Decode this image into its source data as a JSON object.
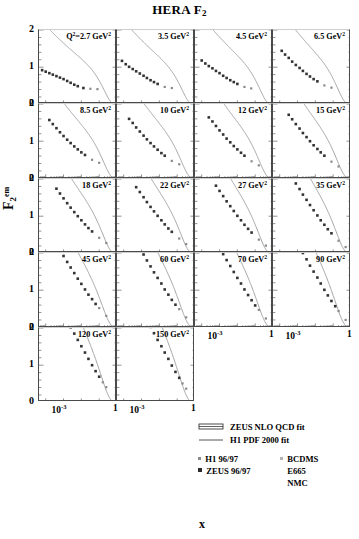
{
  "title": "HERA F2",
  "title_main": "HERA F",
  "title_sub": "2",
  "axes": {
    "ylabel_main": "F",
    "ylabel_sub": "2",
    "ylabel_sup": "em",
    "xlabel": "x",
    "yticks": [
      "2",
      "1",
      "0"
    ],
    "ylim": [
      0,
      2
    ],
    "xticks": [
      {
        "mantissa": "10",
        "exp": "-3"
      },
      {
        "mantissa": "1",
        "exp": ""
      }
    ],
    "xlim_decades": [
      -4.3,
      0
    ]
  },
  "panels": [
    {
      "row": 0,
      "col": 0,
      "label_prefix": "Q",
      "label_sup": "2",
      "label_eq": "=2.7 GeV",
      "label_sup2": "2",
      "q2": 2.7
    },
    {
      "row": 0,
      "col": 1,
      "label_prefix": "",
      "label_sup": "",
      "label_eq": "3.5 GeV",
      "label_sup2": "2",
      "q2": 3.5
    },
    {
      "row": 0,
      "col": 2,
      "label_prefix": "",
      "label_sup": "",
      "label_eq": "4.5 GeV",
      "label_sup2": "2",
      "q2": 4.5
    },
    {
      "row": 0,
      "col": 3,
      "label_prefix": "",
      "label_sup": "",
      "label_eq": "6.5 GeV",
      "label_sup2": "2",
      "q2": 6.5
    },
    {
      "row": 1,
      "col": 0,
      "label_prefix": "",
      "label_sup": "",
      "label_eq": "8.5 GeV",
      "label_sup2": "2",
      "q2": 8.5
    },
    {
      "row": 1,
      "col": 1,
      "label_prefix": "",
      "label_sup": "",
      "label_eq": "10 GeV",
      "label_sup2": "2",
      "q2": 10
    },
    {
      "row": 1,
      "col": 2,
      "label_prefix": "",
      "label_sup": "",
      "label_eq": "12 GeV",
      "label_sup2": "2",
      "q2": 12
    },
    {
      "row": 1,
      "col": 3,
      "label_prefix": "",
      "label_sup": "",
      "label_eq": "15 GeV",
      "label_sup2": "2",
      "q2": 15
    },
    {
      "row": 2,
      "col": 0,
      "label_prefix": "",
      "label_sup": "",
      "label_eq": "18 GeV",
      "label_sup2": "2",
      "q2": 18
    },
    {
      "row": 2,
      "col": 1,
      "label_prefix": "",
      "label_sup": "",
      "label_eq": "22 GeV",
      "label_sup2": "2",
      "q2": 22
    },
    {
      "row": 2,
      "col": 2,
      "label_prefix": "",
      "label_sup": "",
      "label_eq": "27 GeV",
      "label_sup2": "2",
      "q2": 27
    },
    {
      "row": 2,
      "col": 3,
      "label_prefix": "",
      "label_sup": "",
      "label_eq": "35 GeV",
      "label_sup2": "2",
      "q2": 35
    },
    {
      "row": 3,
      "col": 0,
      "label_prefix": "",
      "label_sup": "",
      "label_eq": "45 GeV",
      "label_sup2": "2",
      "q2": 45
    },
    {
      "row": 3,
      "col": 1,
      "label_prefix": "",
      "label_sup": "",
      "label_eq": "60 GeV",
      "label_sup2": "2",
      "q2": 60
    },
    {
      "row": 3,
      "col": 2,
      "label_prefix": "",
      "label_sup": "",
      "label_eq": "70 GeV",
      "label_sup2": "2",
      "q2": 70
    },
    {
      "row": 3,
      "col": 3,
      "label_prefix": "",
      "label_sup": "",
      "label_eq": "90 GeV",
      "label_sup2": "2",
      "q2": 90
    },
    {
      "row": 4,
      "col": 0,
      "label_prefix": "",
      "label_sup": "",
      "label_eq": "120 GeV",
      "label_sup2": "2",
      "q2": 120
    },
    {
      "row": 4,
      "col": 1,
      "label_prefix": "",
      "label_sup": "",
      "label_eq": "150 GeV",
      "label_sup2": "2",
      "q2": 150
    }
  ],
  "legend": {
    "fits": [
      {
        "text": "ZEUS NLO QCD fit",
        "style": "band"
      },
      {
        "text": "H1 PDF 2000 fit",
        "style": "line"
      }
    ],
    "markers_left": [
      {
        "text": "H1 96/97",
        "color": "#8a8a8a",
        "size": 3
      },
      {
        "text": "ZEUS 96/97",
        "color": "#2b2b2b",
        "size": 4
      }
    ],
    "markers_right": [
      {
        "text": "BCDMS",
        "color": "#b4b4b4",
        "size": 3
      },
      {
        "text": "E665",
        "color": "",
        "size": 0
      },
      {
        "text": "NMC",
        "color": "",
        "size": 0
      }
    ]
  },
  "colors": {
    "zeus_marker": "#333333",
    "h1_marker": "#8a8a8a",
    "fit_curve": "#9a9a9a",
    "axis": "#4a4a4a",
    "background": "#ffffff"
  },
  "chart_data": {
    "type": "scatter",
    "title": "HERA F2",
    "xlabel": "x",
    "ylabel": "F2 em",
    "xscale": "log",
    "ylim": [
      0,
      2
    ],
    "xlim": [
      5e-05,
      1.0
    ],
    "grid": false,
    "legend_position": "bottom-right",
    "panels": [
      {
        "q2": 2.7,
        "x": [
          6.3e-05,
          0.0001,
          0.00016,
          0.00025,
          0.0004,
          0.00063,
          0.001,
          0.0016,
          0.0025,
          0.004,
          0.0063,
          0.013,
          0.032,
          0.08
        ],
        "f2": [
          0.92,
          0.88,
          0.84,
          0.8,
          0.76,
          0.72,
          0.68,
          0.63,
          0.58,
          0.53,
          0.49,
          0.44,
          0.42,
          0.41
        ]
      },
      {
        "q2": 3.5,
        "x": [
          8e-05,
          0.00013,
          0.0002,
          0.00032,
          0.0005,
          0.0008,
          0.0013,
          0.002,
          0.0032,
          0.005,
          0.008,
          0.02,
          0.05
        ],
        "f2": [
          1.17,
          1.08,
          1.01,
          0.95,
          0.89,
          0.83,
          0.77,
          0.71,
          0.65,
          0.6,
          0.55,
          0.47,
          0.44
        ]
      },
      {
        "q2": 4.5,
        "x": [
          0.0001,
          0.00016,
          0.00025,
          0.0004,
          0.00063,
          0.001,
          0.0016,
          0.0025,
          0.004,
          0.0063,
          0.01,
          0.025,
          0.06
        ],
        "f2": [
          1.18,
          1.1,
          1.03,
          0.97,
          0.9,
          0.84,
          0.77,
          0.71,
          0.65,
          0.6,
          0.55,
          0.47,
          0.43
        ]
      },
      {
        "q2": 6.5,
        "x": [
          0.00013,
          0.0002,
          0.00032,
          0.0005,
          0.0008,
          0.0013,
          0.002,
          0.0032,
          0.005,
          0.008,
          0.013,
          0.032,
          0.08
        ],
        "f2": [
          1.44,
          1.34,
          1.25,
          1.15,
          1.06,
          0.98,
          0.9,
          0.82,
          0.75,
          0.68,
          0.62,
          0.51,
          0.45
        ]
      },
      {
        "q2": 8.5,
        "x": [
          0.00016,
          0.00025,
          0.0004,
          0.00063,
          0.001,
          0.0016,
          0.0025,
          0.004,
          0.0063,
          0.01,
          0.016,
          0.04,
          0.1
        ],
        "f2": [
          1.57,
          1.46,
          1.35,
          1.24,
          1.14,
          1.04,
          0.95,
          0.86,
          0.78,
          0.7,
          0.63,
          0.5,
          0.42
        ]
      },
      {
        "q2": 10,
        "x": [
          0.0002,
          0.00032,
          0.0005,
          0.0008,
          0.0013,
          0.002,
          0.0032,
          0.005,
          0.008,
          0.013,
          0.02,
          0.05,
          0.13
        ],
        "f2": [
          1.6,
          1.49,
          1.37,
          1.26,
          1.15,
          1.05,
          0.95,
          0.86,
          0.77,
          0.68,
          0.61,
          0.47,
          0.38
        ]
      },
      {
        "q2": 12,
        "x": [
          0.00025,
          0.0004,
          0.00063,
          0.001,
          0.0016,
          0.0025,
          0.004,
          0.0063,
          0.01,
          0.016,
          0.025,
          0.063,
          0.16
        ],
        "f2": [
          1.64,
          1.53,
          1.41,
          1.29,
          1.18,
          1.07,
          0.97,
          0.87,
          0.78,
          0.69,
          0.61,
          0.46,
          0.35
        ]
      },
      {
        "q2": 15,
        "x": [
          0.00032,
          0.0005,
          0.0008,
          0.0013,
          0.002,
          0.0032,
          0.005,
          0.008,
          0.013,
          0.02,
          0.032,
          0.08,
          0.2
        ],
        "f2": [
          1.71,
          1.59,
          1.46,
          1.34,
          1.22,
          1.11,
          1.0,
          0.89,
          0.79,
          0.7,
          0.61,
          0.45,
          0.32
        ]
      },
      {
        "q2": 18,
        "x": [
          0.0004,
          0.00063,
          0.001,
          0.0016,
          0.0025,
          0.004,
          0.0063,
          0.01,
          0.016,
          0.025,
          0.04,
          0.1,
          0.25
        ],
        "f2": [
          1.74,
          1.61,
          1.48,
          1.35,
          1.23,
          1.11,
          1.0,
          0.89,
          0.78,
          0.68,
          0.59,
          0.42,
          0.28
        ]
      },
      {
        "q2": 22,
        "x": [
          0.0005,
          0.0008,
          0.0013,
          0.002,
          0.0032,
          0.005,
          0.008,
          0.013,
          0.02,
          0.032,
          0.05,
          0.13,
          0.32
        ],
        "f2": [
          1.78,
          1.65,
          1.51,
          1.38,
          1.25,
          1.13,
          1.01,
          0.89,
          0.78,
          0.67,
          0.58,
          0.4,
          0.25
        ]
      },
      {
        "q2": 27,
        "x": [
          0.00063,
          0.001,
          0.0016,
          0.0025,
          0.004,
          0.0063,
          0.01,
          0.016,
          0.025,
          0.04,
          0.063,
          0.16,
          0.4
        ],
        "f2": [
          1.82,
          1.68,
          1.54,
          1.4,
          1.27,
          1.14,
          1.01,
          0.89,
          0.77,
          0.66,
          0.56,
          0.37,
          0.21
        ]
      },
      {
        "q2": 35,
        "x": [
          0.0008,
          0.0013,
          0.002,
          0.0032,
          0.005,
          0.008,
          0.013,
          0.02,
          0.032,
          0.05,
          0.08,
          0.2,
          0.5
        ],
        "f2": [
          1.88,
          1.73,
          1.58,
          1.44,
          1.3,
          1.16,
          1.02,
          0.89,
          0.77,
          0.65,
          0.54,
          0.34,
          0.17
        ]
      },
      {
        "q2": 45,
        "x": [
          0.001,
          0.0016,
          0.0025,
          0.004,
          0.0063,
          0.01,
          0.016,
          0.025,
          0.04,
          0.063,
          0.1,
          0.25
        ],
        "f2": [
          1.92,
          1.76,
          1.61,
          1.46,
          1.31,
          1.17,
          1.02,
          0.88,
          0.76,
          0.63,
          0.52,
          0.31
        ]
      },
      {
        "q2": 60,
        "x": [
          0.0013,
          0.002,
          0.0032,
          0.005,
          0.008,
          0.013,
          0.02,
          0.032,
          0.05,
          0.08,
          0.13,
          0.32
        ],
        "f2": [
          1.96,
          1.8,
          1.64,
          1.48,
          1.33,
          1.18,
          1.02,
          0.88,
          0.74,
          0.61,
          0.49,
          0.27
        ]
      },
      {
        "q2": 70,
        "x": [
          0.0016,
          0.0025,
          0.004,
          0.0063,
          0.01,
          0.016,
          0.025,
          0.04,
          0.063,
          0.1,
          0.16,
          0.4
        ],
        "f2": [
          1.97,
          1.81,
          1.65,
          1.49,
          1.33,
          1.18,
          1.02,
          0.87,
          0.73,
          0.59,
          0.47,
          0.24
        ]
      },
      {
        "q2": 90,
        "x": [
          0.002,
          0.0032,
          0.005,
          0.008,
          0.013,
          0.02,
          0.032,
          0.05,
          0.08,
          0.13,
          0.2,
          0.5
        ],
        "f2": [
          2.0,
          1.83,
          1.66,
          1.5,
          1.34,
          1.18,
          1.01,
          0.86,
          0.71,
          0.57,
          0.44,
          0.2
        ]
      },
      {
        "q2": 120,
        "x": [
          0.0025,
          0.004,
          0.0063,
          0.01,
          0.016,
          0.025,
          0.04,
          0.063,
          0.1,
          0.16,
          0.25
        ],
        "f2": [
          2.02,
          1.85,
          1.68,
          1.51,
          1.34,
          1.17,
          1.0,
          0.84,
          0.69,
          0.54,
          0.41
        ]
      },
      {
        "q2": 150,
        "x": [
          0.0032,
          0.005,
          0.008,
          0.013,
          0.02,
          0.032,
          0.05,
          0.08,
          0.13,
          0.2,
          0.32
        ],
        "f2": [
          2.03,
          1.86,
          1.68,
          1.51,
          1.34,
          1.17,
          0.99,
          0.82,
          0.66,
          0.51,
          0.37
        ]
      }
    ],
    "series": [
      {
        "name": "ZEUS NLO QCD fit",
        "type": "band"
      },
      {
        "name": "H1 PDF 2000 fit",
        "type": "line"
      },
      {
        "name": "H1 96/97",
        "type": "marker"
      },
      {
        "name": "ZEUS 96/97",
        "type": "marker"
      },
      {
        "name": "BCDMS",
        "type": "marker"
      },
      {
        "name": "E665",
        "type": "marker"
      },
      {
        "name": "NMC",
        "type": "marker"
      }
    ]
  }
}
